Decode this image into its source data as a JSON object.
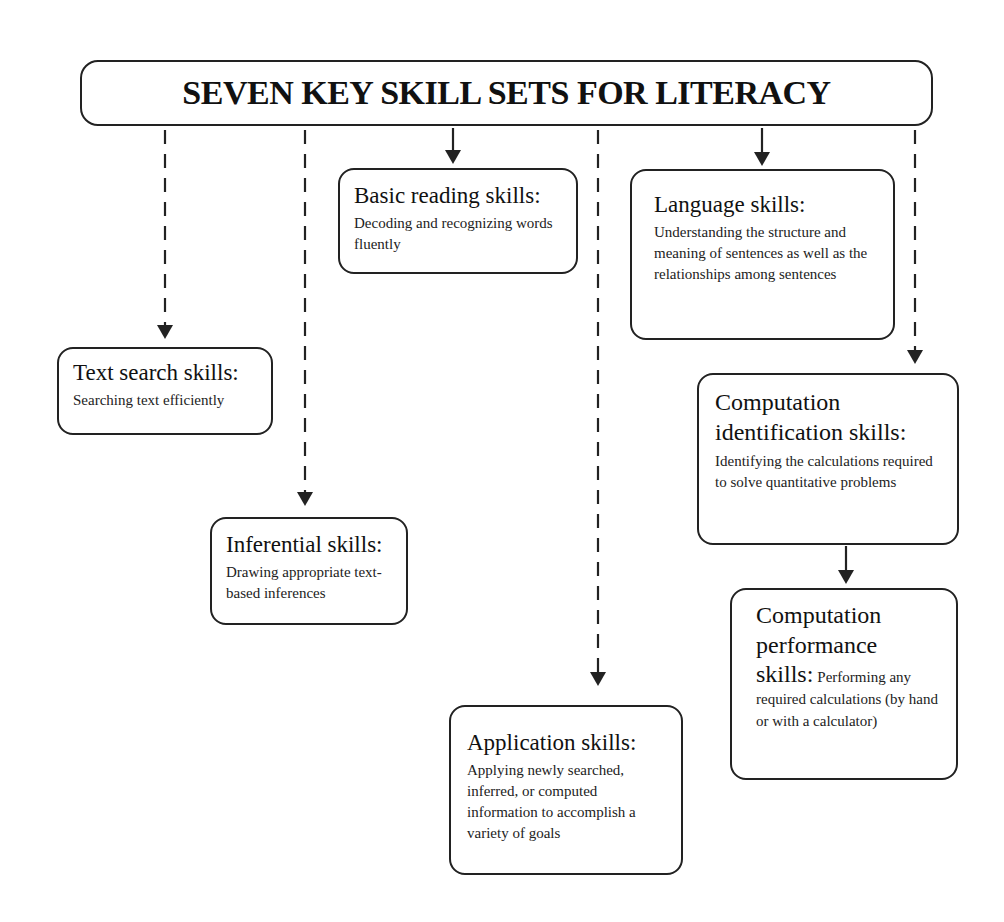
{
  "title": "SEVEN KEY SKILL SETS FOR LITERACY",
  "colors": {
    "line": "#222222",
    "background": "#ffffff",
    "text": "#111111"
  },
  "connector_legend": {
    "dashed": "dashed-arrow-from-title",
    "solid": "solid-arrow"
  },
  "skills": [
    {
      "id": "text-search",
      "heading": "Text search skills:",
      "description": "Searching text efficiently",
      "connector": "dashed"
    },
    {
      "id": "inferential",
      "heading": "Inferential skills:",
      "description": "Drawing appropriate text-based inferences",
      "connector": "dashed"
    },
    {
      "id": "basic-reading",
      "heading": "Basic reading skills:",
      "description": "Decoding and recognizing words fluently",
      "connector": "solid"
    },
    {
      "id": "application",
      "heading": "Application skills:",
      "description": "Applying newly searched, inferred, or computed information to accomplish a variety of goals",
      "connector": "dashed"
    },
    {
      "id": "language",
      "heading": "Language skills:",
      "description": "Understanding the structure and meaning of sentences as well as the relationships among sentences",
      "connector": "solid"
    },
    {
      "id": "computation-identification",
      "heading": "Computation identification skills:",
      "description": "Identifying the calculations required to solve quantitative problems",
      "connector": "dashed"
    },
    {
      "id": "computation-performance",
      "heading": "Computation performance skills:",
      "heading_lines": [
        "Computation",
        "performance",
        "skills:"
      ],
      "description": "Performing any required calculations (by hand or with a calculator)",
      "connector": "solid-from-computation-identification"
    }
  ]
}
